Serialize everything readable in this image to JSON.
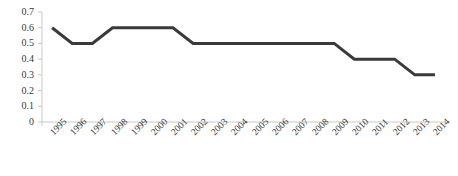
{
  "chart_data": {
    "type": "line",
    "title": "",
    "subtitle": "",
    "xlabel": "",
    "ylabel": "",
    "categories": [
      "1995",
      "1996",
      "1997",
      "1998",
      "1999",
      "2000",
      "2001",
      "2002",
      "2003",
      "2004",
      "2005",
      "2006",
      "2007",
      "2008",
      "2009",
      "2010",
      "2011",
      "2012",
      "2013",
      "2014"
    ],
    "values": [
      0.6,
      0.5,
      0.5,
      0.6,
      0.6,
      0.6,
      0.6,
      0.5,
      0.5,
      0.5,
      0.5,
      0.5,
      0.5,
      0.5,
      0.5,
      0.4,
      0.4,
      0.4,
      0.3,
      0.3
    ],
    "series": [
      {
        "name": "",
        "values": [
          0.6,
          0.5,
          0.5,
          0.6,
          0.6,
          0.6,
          0.6,
          0.5,
          0.5,
          0.5,
          0.5,
          0.5,
          0.5,
          0.5,
          0.5,
          0.4,
          0.4,
          0.4,
          0.3,
          0.3
        ],
        "color": "#3a3a3a"
      }
    ],
    "ylim": [
      0,
      0.7
    ],
    "yticks": [
      0,
      0.1,
      0.2,
      0.3,
      0.4,
      0.5,
      0.6,
      0.7
    ],
    "ytick_labels": [
      "0",
      "0.1",
      "0.2",
      "0.3",
      "0.4",
      "0.5",
      "0.6",
      "0.7"
    ],
    "grid": false,
    "legend": false,
    "legend_position": "none",
    "markers": false,
    "line_width": 3,
    "axis_color": "#c9c9c9",
    "text_color": "#3a3a3a"
  }
}
